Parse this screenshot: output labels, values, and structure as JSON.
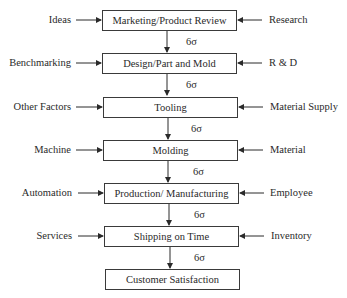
{
  "diagram": {
    "type": "flowchart",
    "step_label": "6σ",
    "steps": [
      {
        "label": "Marketing/Product Review",
        "left_input": "Ideas",
        "right_input": "Research"
      },
      {
        "label": "Design/Part and Mold",
        "left_input": "Benchmarking",
        "right_input": "R & D"
      },
      {
        "label": "Tooling",
        "left_input": "Other Factors",
        "right_input": "Material Supply"
      },
      {
        "label": "Molding",
        "left_input": "Machine",
        "right_input": "Material"
      },
      {
        "label": "Production/ Manufacturing",
        "left_input": "Automation",
        "right_input": "Employee"
      },
      {
        "label": "Shipping on Time",
        "left_input": "Services",
        "right_input": "Inventory"
      },
      {
        "label": "Customer Satisfaction"
      }
    ],
    "sigma": [
      "6σ",
      "6σ",
      "6σ",
      "6σ",
      "6σ",
      "6σ"
    ]
  }
}
